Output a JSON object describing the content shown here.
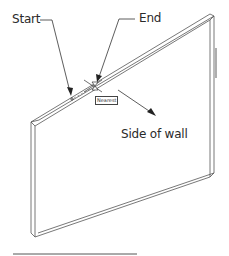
{
  "diagram": {
    "labels": {
      "start": "Start",
      "end": "End",
      "side_of_wall": "Side of wall",
      "snap_tooltip": "Nearest"
    },
    "colors": {
      "line": "#555555",
      "arrow": "#222222",
      "text": "#2a2a2a",
      "background": "#ffffff"
    }
  }
}
